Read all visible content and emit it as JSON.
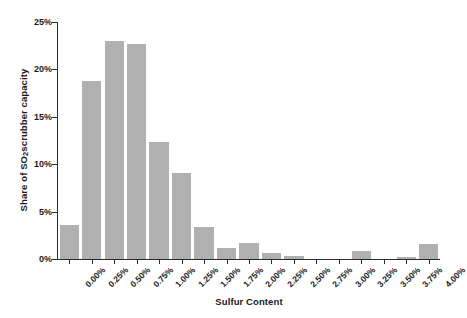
{
  "chart_data": {
    "type": "bar",
    "title": "",
    "subtitle": "",
    "xlabel": "Sulfur Content",
    "ylabel": "Share of SO2 scrubber capacity",
    "ylabel_parts": {
      "pre": "Share of SO",
      "sub": "2",
      "post": " scrubber capacity"
    },
    "categories": [
      "0.00%",
      "0.25%",
      "0.50%",
      "0.75%",
      "1.00%",
      "1.25%",
      "1.50%",
      "1.75%",
      "2.00%",
      "2.25%",
      "2.50%",
      "2.75%",
      "3.00%",
      "3.25%",
      "3.50%",
      "3.75%",
      "4.00%"
    ],
    "values": [
      3.6,
      18.8,
      23.0,
      22.7,
      12.3,
      9.1,
      3.4,
      1.2,
      1.7,
      0.6,
      0.3,
      0.0,
      0.0,
      0.8,
      0.0,
      0.2,
      1.6
    ],
    "ylim": [
      0,
      25
    ],
    "yticks": [
      0,
      5,
      10,
      15,
      20,
      25
    ],
    "ytick_labels": [
      "0%",
      "5%",
      "10%",
      "15%",
      "20%",
      "25%"
    ],
    "grid": false,
    "legend": "none",
    "bar_color": "#b0b0b0",
    "axis_color": "#2b2b2b",
    "background_color": "#ffffff"
  }
}
